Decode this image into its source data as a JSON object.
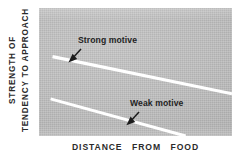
{
  "chart_data": {
    "type": "line",
    "title": "",
    "subtitle": "",
    "xlabel": "DISTANCE FROM FOOD",
    "ylabel_lines": [
      "STRENGTH OF",
      "TENDENCY TO APPROACH"
    ],
    "grid": false,
    "legend_position": "inline-annotations",
    "panel_color": "#bfbfbf",
    "line_color": "#ffffff",
    "annotation_color": "#232323",
    "axis_ranges": {
      "x": [
        0,
        1
      ],
      "y": [
        0,
        1
      ]
    },
    "series": [
      {
        "name": "Strong motive",
        "label": "Strong motive",
        "color": "#ffffff",
        "points": [
          {
            "x": 0.07,
            "y": 0.62
          },
          {
            "x": 1.0,
            "y": 0.33
          }
        ]
      },
      {
        "name": "Weak motive",
        "label": "Weak motive",
        "color": "#ffffff",
        "points": [
          {
            "x": 0.06,
            "y": 0.29
          },
          {
            "x": 0.76,
            "y": 0.0
          }
        ]
      }
    ],
    "annotations": [
      {
        "name": "strong-motive-annotation",
        "text": "Strong motive",
        "target_series": "Strong motive",
        "arrow": "down-left"
      },
      {
        "name": "weak-motive-annotation",
        "text": "Weak motive",
        "target_series": "Weak motive",
        "arrow": "down-left"
      }
    ]
  },
  "axes": {
    "y": {
      "line1": "STRENGTH OF",
      "line2": "TENDENCY TO APPROACH"
    },
    "x": {
      "word1": "DISTANCE",
      "word2": "FROM",
      "word3": "FOOD"
    }
  },
  "labels": {
    "strong_motive": "Strong motive",
    "weak_motive": "Weak motive"
  }
}
